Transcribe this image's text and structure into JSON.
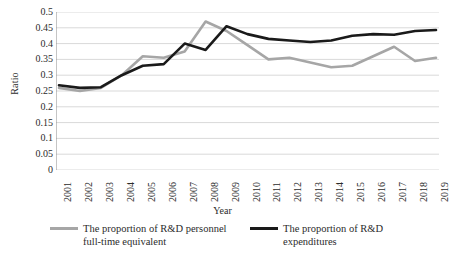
{
  "chart_data": {
    "type": "line",
    "title": "",
    "xlabel": "Year",
    "ylabel": "Ratio",
    "ylim": [
      0,
      0.5
    ],
    "yticks": [
      "0",
      "0.05",
      "0.1",
      "0.15",
      "0.2",
      "0.25",
      "0.3",
      "0.35",
      "0.4",
      "0.45",
      "0.5"
    ],
    "ytick_values": [
      0,
      0.05,
      0.1,
      0.15,
      0.2,
      0.25,
      0.3,
      0.35,
      0.4,
      0.45,
      0.5
    ],
    "grid": true,
    "legend_position": "bottom",
    "categories": [
      "2001",
      "2002",
      "2003",
      "2004",
      "2005",
      "2006",
      "2007",
      "2008",
      "2009",
      "2010",
      "2011",
      "2012",
      "2013",
      "2014",
      "2015",
      "2016",
      "2017",
      "2018",
      "2019"
    ],
    "series": [
      {
        "name": "The proportion of R&D personnel full-time equivalent",
        "name_line1": "The proportion of R&D personnel",
        "name_line2": "full-time equivalent",
        "color": "#a6a6a6",
        "values": [
          0.26,
          0.25,
          0.26,
          0.3,
          0.36,
          0.355,
          0.375,
          0.47,
          0.44,
          0.395,
          0.35,
          0.355,
          0.34,
          0.325,
          0.33,
          0.36,
          0.39,
          0.345,
          0.355
        ]
      },
      {
        "name": "The proportion of R&D expenditures",
        "name_line1": "The proportion of R&D",
        "name_line2": "expenditures",
        "color": "#1a1a1a",
        "values": [
          0.268,
          0.26,
          0.262,
          0.3,
          0.33,
          0.335,
          0.4,
          0.38,
          0.455,
          0.43,
          0.415,
          0.41,
          0.405,
          0.41,
          0.425,
          0.43,
          0.428,
          0.44,
          0.443
        ]
      }
    ]
  }
}
